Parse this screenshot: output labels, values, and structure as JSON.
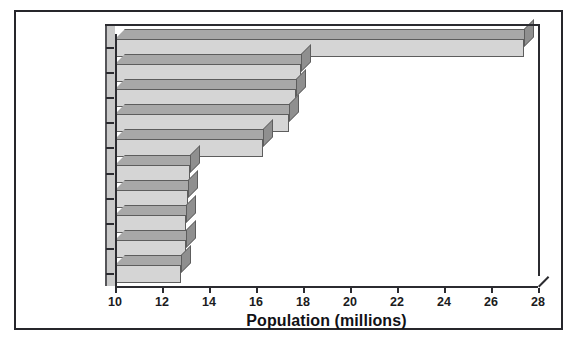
{
  "chart_data": {
    "type": "bar",
    "orientation": "horizontal",
    "title": "",
    "xlabel": "Population (millions)",
    "ylabel": "",
    "xlim": [
      10,
      28
    ],
    "xticks": [
      10,
      12,
      14,
      16,
      18,
      20,
      22,
      24,
      26,
      28
    ],
    "xtick_labels": [
      "10",
      "12",
      "14",
      "16",
      "18",
      "20",
      "22",
      "24",
      "26",
      "28"
    ],
    "grid": false,
    "legend": null,
    "style": "3d-bar",
    "categories": [
      "Tokyo",
      "Mexico City",
      "Mumbai",
      "Sao Paulo",
      "New York",
      "Lagos",
      "Los Angeles",
      "Calcutta",
      "Shanghai",
      "Buenos Aires"
    ],
    "values": [
      27.4,
      17.9,
      17.7,
      17.4,
      16.3,
      13.2,
      13.1,
      13.0,
      13.0,
      12.8
    ],
    "bar_face_color": "#d5d5d5",
    "bar_top_color": "#a8a8a8",
    "bar_side_color": "#8f8f8f",
    "axis_color": "#2b2b30",
    "frame_color": "#26262b",
    "background_color": "#ffffff"
  }
}
